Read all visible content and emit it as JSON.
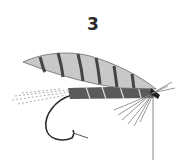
{
  "figure": {
    "number_label": "3",
    "colors": {
      "ink": "#2a2a2a",
      "wing_light": "#c9c9c9",
      "wing_band": "#4a4a4a",
      "body": "#555555",
      "hackle": "#8a8a8a",
      "background": "#ffffff"
    }
  }
}
